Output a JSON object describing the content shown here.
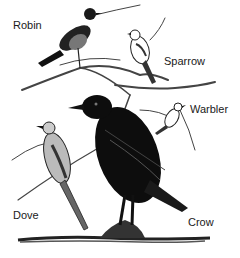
{
  "figure": {
    "labels": {
      "robin": "Robin",
      "sparrow": "Sparrow",
      "warbler": "Warbler",
      "dove": "Dove",
      "crow": "Crow"
    }
  },
  "colors": {
    "ink": "#111111",
    "background": "#ffffff",
    "branch": "#555555"
  }
}
